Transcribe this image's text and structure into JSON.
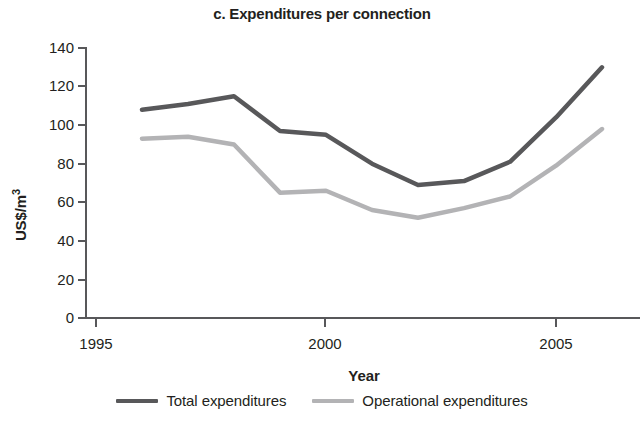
{
  "figure": {
    "title": "c. Expenditures per connection"
  },
  "legend": {
    "position": "bottom-center",
    "entries": [
      {
        "label": "Total expenditures",
        "color": "#58585a"
      },
      {
        "label": "Operational expenditures",
        "color": "#b3b3b5"
      }
    ]
  },
  "chart_data": {
    "type": "line",
    "title": "c. Expenditures per connection",
    "xlabel": "Year",
    "ylabel": "US$/m³",
    "xlim": [
      1995,
      2006.2
    ],
    "ylim": [
      0,
      145
    ],
    "grid": false,
    "legend_position": "bottom-center",
    "xticks": [
      1995,
      2000,
      2005
    ],
    "xtick_labels": [
      "1995",
      "2000",
      "2005"
    ],
    "yticks": [
      0,
      20,
      40,
      60,
      80,
      100,
      120,
      140
    ],
    "ytick_labels": [
      "0",
      "20",
      "40",
      "60",
      "80",
      "100",
      "120",
      "140"
    ],
    "x": [
      1996,
      1997,
      1998,
      1999,
      2000,
      2001,
      2002,
      2003,
      2004,
      2005,
      2006
    ],
    "series": [
      {
        "name": "Total expenditures",
        "color": "#58585a",
        "values": [
          108,
          111,
          115,
          97,
          95,
          80,
          69,
          71,
          81,
          104,
          130
        ]
      },
      {
        "name": "Operational expenditures",
        "color": "#b3b3b5",
        "values": [
          93,
          94,
          90,
          65,
          66,
          56,
          52,
          57,
          63,
          79,
          98
        ]
      }
    ]
  },
  "axes": {
    "y_label": "US$/m³",
    "y_label_main": "US$/m",
    "y_label_sup": "3",
    "x_label": "Year"
  }
}
